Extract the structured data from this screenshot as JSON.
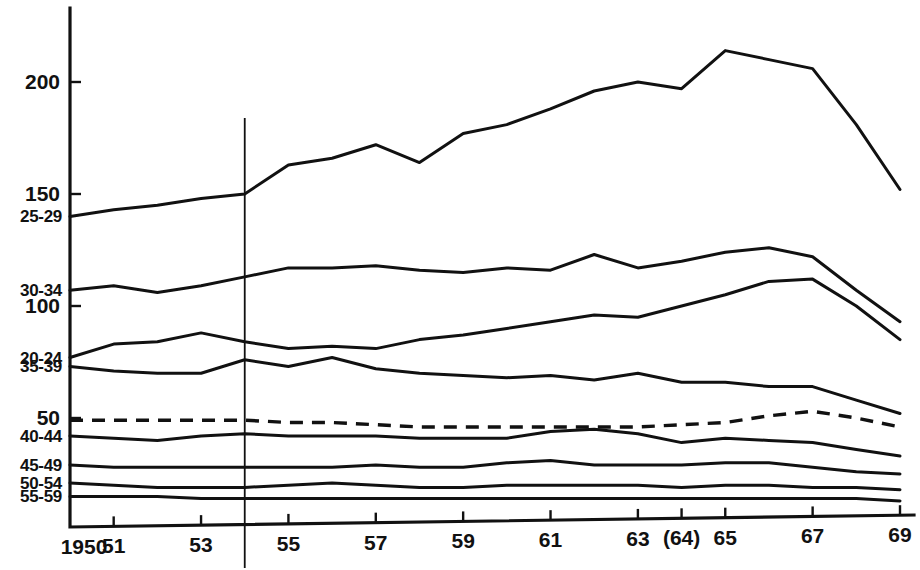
{
  "chart_data": {
    "type": "line",
    "title": "",
    "subtitle": "",
    "xlabel": "",
    "ylabel": "",
    "xlim": [
      1950,
      1969
    ],
    "ylim": [
      0,
      225
    ],
    "grid": false,
    "legend_position": "inline-left-axis",
    "x": [
      1950,
      1951,
      1952,
      1953,
      1954,
      1955,
      1956,
      1957,
      1958,
      1959,
      1960,
      1961,
      1962,
      1963,
      1964,
      1965,
      1966,
      1967,
      1968,
      1969
    ],
    "x_tick_labels": [
      "1950",
      "51",
      "53",
      "55",
      "57",
      "59",
      "61",
      "63",
      "(64)",
      "65",
      "67",
      "69"
    ],
    "x_tick_values": [
      1950,
      1951,
      1953,
      1955,
      1957,
      1959,
      1961,
      1963,
      1964,
      1965,
      1967,
      1969
    ],
    "y_tick_labels": [
      "200",
      "150",
      "100",
      "50"
    ],
    "y_tick_values": [
      200,
      150,
      100,
      50
    ],
    "annotations": [
      {
        "name": "reference-line",
        "x": 1954,
        "style": "solid-vertical"
      }
    ],
    "series": [
      {
        "name": "25-29",
        "label": "25-29",
        "style": "solid",
        "label_y_value": 140,
        "values": [
          140,
          143,
          145,
          148,
          150,
          163,
          166,
          172,
          164,
          177,
          181,
          188,
          196,
          200,
          197,
          214,
          210,
          206,
          181,
          152
        ]
      },
      {
        "name": "30-34",
        "label": "30-34",
        "style": "solid",
        "label_y_value": 107,
        "values": [
          107,
          109,
          106,
          109,
          113,
          117,
          117,
          118,
          116,
          115,
          117,
          116,
          123,
          117,
          120,
          124,
          126,
          122,
          107,
          93
        ]
      },
      {
        "name": "20-24",
        "label": "20-24",
        "style": "solid",
        "label_y_value": 77,
        "values": [
          77,
          83,
          84,
          88,
          84,
          81,
          82,
          81,
          85,
          87,
          90,
          93,
          96,
          95,
          100,
          105,
          111,
          112,
          100,
          85
        ]
      },
      {
        "name": "35-39",
        "label": "35-39",
        "style": "solid",
        "label_y_value": 73,
        "values": [
          73,
          71,
          70,
          70,
          76,
          73,
          77,
          72,
          70,
          69,
          68,
          69,
          67,
          70,
          66,
          66,
          64,
          64,
          58,
          52
        ]
      },
      {
        "name": "total",
        "label": "",
        "style": "dashed",
        "label_y_value": 49,
        "values": [
          49,
          49,
          49,
          49,
          49,
          48,
          48,
          47,
          46,
          46,
          46,
          46,
          46,
          46,
          47,
          48,
          51,
          53,
          50,
          46
        ]
      },
      {
        "name": "40-44",
        "label": "40-44",
        "style": "solid",
        "label_y_value": 42,
        "values": [
          42,
          41,
          40,
          42,
          43,
          42,
          42,
          42,
          41,
          41,
          41,
          44,
          45,
          43,
          39,
          41,
          40,
          39,
          36,
          33
        ]
      },
      {
        "name": "45-49",
        "label": "45-49",
        "style": "solid",
        "label_y_value": 29,
        "values": [
          29,
          28,
          28,
          28,
          28,
          28,
          28,
          29,
          28,
          28,
          30,
          31,
          29,
          29,
          29,
          30,
          30,
          28,
          26,
          25
        ]
      },
      {
        "name": "50-54",
        "label": "50-54",
        "style": "solid",
        "label_y_value": 21,
        "values": [
          21,
          20,
          19,
          19,
          19,
          20,
          21,
          20,
          19,
          19,
          20,
          20,
          20,
          20,
          19,
          20,
          20,
          19,
          19,
          18
        ]
      },
      {
        "name": "55-59",
        "label": "55-59",
        "style": "solid",
        "label_y_value": 15,
        "values": [
          15,
          15,
          15,
          14,
          14,
          14,
          14,
          14,
          14,
          14,
          14,
          14,
          14,
          14,
          14,
          14,
          14,
          14,
          14,
          13
        ]
      }
    ]
  }
}
